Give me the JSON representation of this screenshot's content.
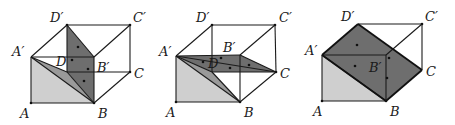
{
  "colors": {
    "light_fill": "#cfcfcf",
    "mid_fill": "#9a9a9a",
    "dark_fill": "#6e6e6e",
    "stroke": "#1a1a1a",
    "background": "#ffffff"
  },
  "figures": [
    {
      "id": "fig1",
      "labels": {
        "A": "A",
        "B": "B",
        "C": "C",
        "D": "D",
        "A1": "A′",
        "B1": "B′",
        "C1": "C′",
        "D1": "D′"
      }
    },
    {
      "id": "fig2",
      "labels": {
        "A": "A",
        "B": "B",
        "C": "C",
        "D": "D",
        "A1": "A′",
        "B1": "B′",
        "C1": "C′",
        "D1": "D′"
      }
    },
    {
      "id": "fig3",
      "labels": {
        "A": "A",
        "B": "B",
        "C": "C",
        "A1": "A′",
        "B1": "B′",
        "C1": "C′",
        "D1": "D′"
      }
    }
  ]
}
